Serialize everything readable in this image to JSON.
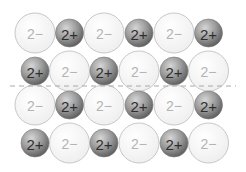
{
  "diagram": {
    "title": "",
    "ion_types": {
      "anion": {
        "label": "2−",
        "fill": "#f6f6f6",
        "stroke": "#c8c8c8",
        "text_color": "#b4b4b4"
      },
      "cation": {
        "label": "2+",
        "fill_light": "#c9c9c9",
        "fill_dark": "#6e6e6e",
        "stroke": "#7a7a7a",
        "text_color": "#2e2e2e"
      }
    },
    "rows": [
      [
        "anion",
        "cation",
        "anion",
        "cation",
        "anion",
        "cation"
      ],
      [
        "cation",
        "anion",
        "cation",
        "anion",
        "cation",
        "anion"
      ],
      [
        "anion",
        "cation",
        "anion",
        "cation",
        "anion",
        "cation"
      ],
      [
        "cation",
        "anion",
        "cation",
        "anion",
        "cation",
        "anion"
      ]
    ],
    "divider": {
      "style": "dashed",
      "color": "#a8a8a8",
      "after_row": 2
    }
  }
}
